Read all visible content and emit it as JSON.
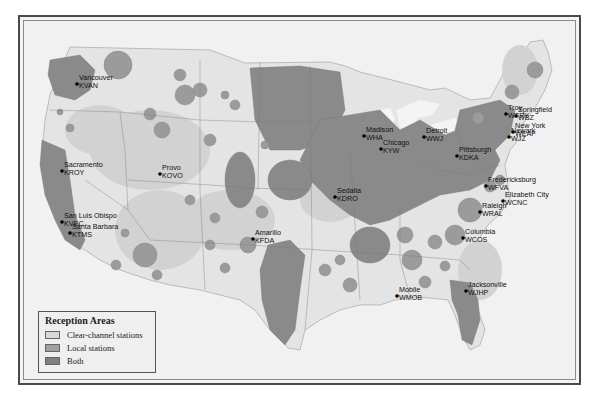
{
  "legend": {
    "title": "Reception Areas",
    "items": [
      {
        "label": "Clear-channel stations",
        "color": "#d9d9d9"
      },
      {
        "label": "Local stations",
        "color": "#9a9a9a"
      },
      {
        "label": "Both",
        "color": "#808080"
      }
    ]
  },
  "colors": {
    "background": "#f1f1f1",
    "land": "#e6e6e6",
    "clear_channel": "#d3d3d3",
    "local": "#9b9b9b",
    "both": "#858585",
    "border": "#6d6d6d"
  },
  "stations": [
    {
      "city": "Vancouver",
      "call": "KVAN",
      "x": 77,
      "y": 84
    },
    {
      "city": "Sacramento",
      "call": "KROY",
      "x": 62,
      "y": 171
    },
    {
      "city": "San Luis Obispo",
      "call": "KVEC",
      "x": 62,
      "y": 222
    },
    {
      "city": "Santa Barbara",
      "call": "KTMS",
      "x": 70,
      "y": 233
    },
    {
      "city": "Provo",
      "call": "KOVO",
      "x": 160,
      "y": 174
    },
    {
      "city": "Amarillo",
      "call": "KFDA",
      "x": 253,
      "y": 239
    },
    {
      "city": "Sedalia",
      "call": "KDRO",
      "x": 335,
      "y": 197
    },
    {
      "city": "Madison",
      "call": "WHA",
      "x": 364,
      "y": 136
    },
    {
      "city": "Chicago",
      "call": "KYW",
      "x": 381,
      "y": 149
    },
    {
      "city": "Detroit",
      "call": "WWJ",
      "x": 424,
      "y": 137
    },
    {
      "city": "Pittsburgh",
      "call": "KDKA",
      "x": 457,
      "y": 156
    },
    {
      "city": "Fredericksburg",
      "call": "WFVA",
      "x": 486,
      "y": 186
    },
    {
      "city": "Troy",
      "call": "WTRY",
      "x": 506,
      "y": 114
    },
    {
      "city": "Springfield",
      "call": "WBZ",
      "x": 516,
      "y": 116
    },
    {
      "city": "New York",
      "call": "WEAF",
      "x": 513,
      "y": 132
    },
    {
      "city": "Newark",
      "call": "WJZ",
      "x": 509,
      "y": 137
    },
    {
      "city": "Elizabeth City",
      "call": "WCNC",
      "x": 503,
      "y": 201
    },
    {
      "city": "Raleigh",
      "call": "WRAL",
      "x": 480,
      "y": 212
    },
    {
      "city": "Columbia",
      "call": "WCOS",
      "x": 463,
      "y": 238
    },
    {
      "city": "Mobile",
      "call": "WMOB",
      "x": 397,
      "y": 296
    },
    {
      "city": "Jacksonville",
      "call": "WJHP",
      "x": 466,
      "y": 291
    }
  ]
}
